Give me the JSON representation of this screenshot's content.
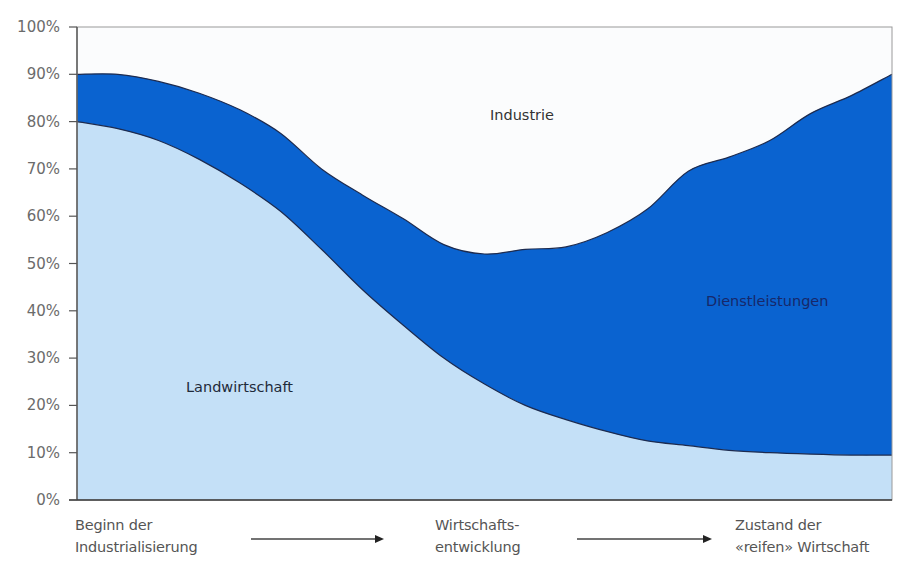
{
  "chart_data": {
    "type": "area",
    "stacked": true,
    "title": "",
    "xlabel": "",
    "ylabel": "",
    "ylim": [
      0,
      100
    ],
    "yticks": [
      "0%",
      "10%",
      "20%",
      "30%",
      "40%",
      "50%",
      "60%",
      "70%",
      "80%",
      "90%",
      "100%"
    ],
    "x_stages": [
      {
        "label_line1": "Beginn der",
        "label_line2": "Industrialisierung"
      },
      {
        "label_line1": "Wirtschafts-",
        "label_line2": "entwicklung"
      },
      {
        "label_line1": "Zustand der",
        "label_line2": "«reifen» Wirtschaft"
      }
    ],
    "x": [
      0,
      0.05,
      0.1,
      0.15,
      0.2,
      0.25,
      0.3,
      0.35,
      0.4,
      0.45,
      0.5,
      0.55,
      0.6,
      0.65,
      0.7,
      0.75,
      0.8,
      0.85,
      0.9,
      0.95,
      1.0
    ],
    "series": [
      {
        "name": "Landwirtschaft",
        "color": "#c4e0f7",
        "values": [
          80,
          78.5,
          76,
          72,
          67,
          61,
          53,
          44.5,
          37,
          30,
          24.5,
          20,
          17,
          14.5,
          12.5,
          11.5,
          10.5,
          10,
          9.7,
          9.5,
          9.5
        ]
      },
      {
        "name": "Dienstleistungen",
        "color": "#0a63d0",
        "values": [
          10,
          11.5,
          12.5,
          14,
          15.5,
          16.5,
          17,
          20,
          22.5,
          24,
          27.5,
          33,
          36.5,
          42,
          49,
          58,
          62,
          66,
          72,
          76,
          80.5
        ]
      },
      {
        "name": "Industrie",
        "color": "#fbfcfd",
        "values": [
          10,
          10,
          11.5,
          14,
          17.5,
          22.5,
          30,
          35.5,
          40.5,
          46,
          48,
          47,
          46.5,
          43.5,
          38.5,
          30.5,
          27.5,
          24,
          18.3,
          14.5,
          10
        ]
      }
    ],
    "upper_boundary_pct": [
      90,
      90,
      88.5,
      86,
      82.5,
      77.5,
      70,
      64.5,
      59.5,
      54,
      52,
      53,
      53.5,
      56.5,
      61.5,
      69.5,
      72.5,
      76,
      81.7,
      85.5,
      90
    ],
    "area_labels": [
      {
        "series": "Landwirtschaft",
        "text": "Landwirtschaft",
        "color": "#1f2a3a"
      },
      {
        "series": "Dienstleistungen",
        "text": "Dienstleistungen",
        "color": "#17286a"
      },
      {
        "series": "Industrie",
        "text": "Industrie",
        "color": "#333333"
      }
    ],
    "legend": "none (labels inside areas)",
    "grid": false
  },
  "axis": {
    "line_color": "#555555",
    "tick_label_color": "#6b6b6b"
  }
}
